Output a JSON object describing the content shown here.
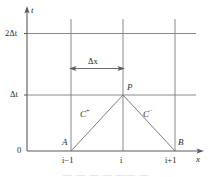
{
  "figure": {
    "axes": {
      "y_axis_label": "t",
      "x_axis_label": "x",
      "origin_label": "0"
    },
    "y_ticks": [
      {
        "label": "2Δt",
        "value": "2dt"
      },
      {
        "label": "Δt",
        "value": "dt"
      }
    ],
    "x_ticks": [
      {
        "label": "i−1"
      },
      {
        "label": "i"
      },
      {
        "label": "i+1"
      }
    ],
    "points": [
      {
        "name": "A",
        "label": "A"
      },
      {
        "name": "B",
        "label": "B"
      },
      {
        "name": "P",
        "label": "P"
      }
    ],
    "characteristics": [
      {
        "name": "C-plus",
        "base": "C",
        "sup": "+"
      },
      {
        "name": "C-minus",
        "base": "C",
        "sup": "−"
      }
    ],
    "dimension": {
      "label": "Δx"
    },
    "caption": "—  —   —    —                     ——  —",
    "colors": {
      "line": "#6e6e6e",
      "axis": "#5a5a5a",
      "text": "#2b2b2b",
      "background": "#ffffff"
    }
  }
}
